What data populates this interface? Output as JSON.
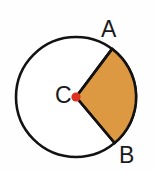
{
  "figure": {
    "type": "circle-sector-diagram",
    "background_color": "#fefefe",
    "circle": {
      "center_x": 76,
      "center_y": 97,
      "radius": 60,
      "stroke_color": "#121212",
      "stroke_width": 2.6,
      "fill_color": "#ffffff"
    },
    "sector": {
      "fill_color": "#dc9941",
      "stroke_color": "#121212",
      "stroke_width": 2.6,
      "start_point_label": "A",
      "end_point_label": "B",
      "start_angle_deg": -53,
      "end_angle_deg": 50,
      "sweep_deg": 103,
      "point_a_x": 112,
      "point_a_y": 49,
      "point_b_x": 115,
      "point_b_y": 143
    },
    "center_dot": {
      "fill_color": "#e0301e",
      "radius": 4.6,
      "x": 76,
      "y": 97
    },
    "labels": {
      "a": "A",
      "b": "B",
      "c": "C"
    }
  }
}
